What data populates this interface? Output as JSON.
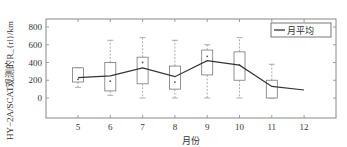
{
  "chart_data": {
    "type": "box",
    "title": "",
    "xlabel": "月份",
    "ylabel": "HY−2A/SCAT观测的R_{rl}/km",
    "categories": [
      "5",
      "6",
      "7",
      "8",
      "9",
      "10",
      "11",
      "12"
    ],
    "ylim": [
      -200,
      850
    ],
    "yticks": [
      0,
      200,
      400,
      600,
      800
    ],
    "xlim": [
      4,
      13
    ],
    "legend": {
      "position": "top-right",
      "entries": [
        "月平均"
      ]
    },
    "grid": false,
    "boxes": [
      {
        "month": 5,
        "whisker_low": 120,
        "q1": 180,
        "q3": 340,
        "whisker_high": 340,
        "marker": 210
      },
      {
        "month": 6,
        "whisker_low": 30,
        "q1": 80,
        "q3": 400,
        "whisker_high": 650,
        "marker": 190
      },
      {
        "month": 7,
        "whisker_low": 0,
        "q1": 160,
        "q3": 460,
        "whisker_high": 680,
        "marker": 400
      },
      {
        "month": 8,
        "whisker_low": 0,
        "q1": 100,
        "q3": 360,
        "whisker_high": 650,
        "marker": 180
      },
      {
        "month": 9,
        "whisker_low": 0,
        "q1": 260,
        "q3": 540,
        "whisker_high": 600,
        "marker": 470
      },
      {
        "month": 10,
        "whisker_low": 0,
        "q1": 200,
        "q3": 520,
        "whisker_high": 680,
        "marker": 370
      },
      {
        "month": 11,
        "whisker_low": 0,
        "q1": 0,
        "q3": 200,
        "whisker_high": 380,
        "marker": null
      }
    ],
    "series": [
      {
        "name": "月平均",
        "type": "line",
        "x": [
          5,
          6,
          7,
          8,
          9,
          10,
          11,
          12
        ],
        "values": [
          230,
          250,
          340,
          240,
          420,
          370,
          130,
          90
        ]
      }
    ]
  }
}
